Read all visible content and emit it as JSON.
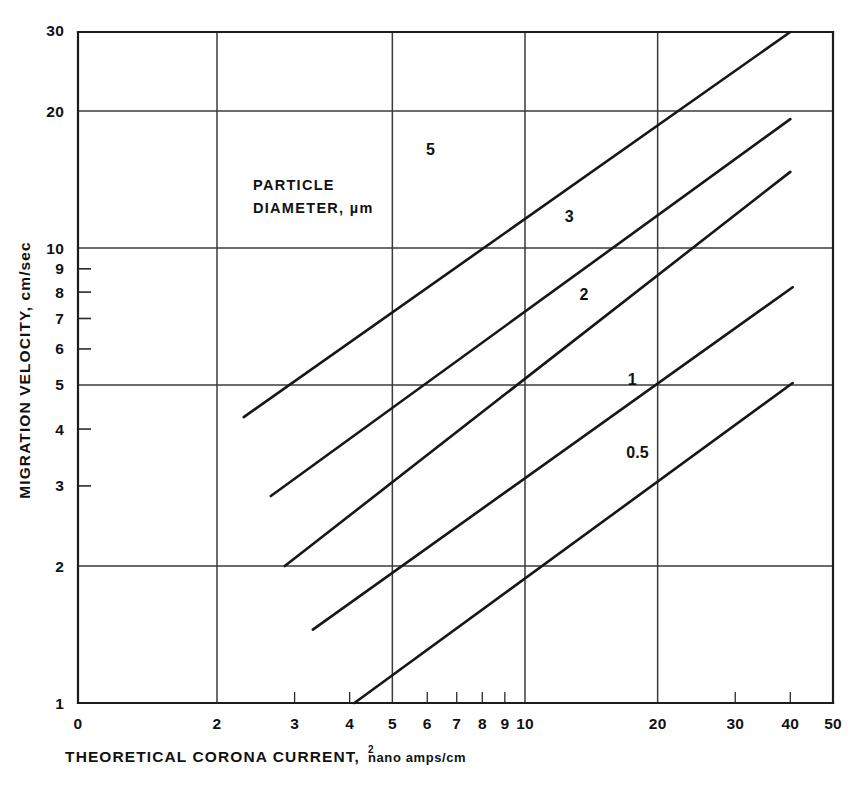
{
  "chart_data": {
    "type": "line",
    "title": "",
    "xlabel": "THEORETICAL CORONA CURRENT, nano amps/cm2",
    "xlabel_main": "THEORETICAL CORONA CURRENT,",
    "xlabel_units": "nano amps/cm",
    "xlabel_exponent": "2",
    "ylabel": "MIGRATION VELOCITY, cm/sec",
    "xscale": "log",
    "yscale": "log",
    "xlim": [
      1.75,
      50
    ],
    "ylim": [
      1,
      30
    ],
    "grid": true,
    "legend_position": "inline-curve-labels",
    "annotation": {
      "line1": "PARTICLE",
      "line2": "DIAMETER, µm"
    },
    "xticks_major": [
      2,
      5,
      10,
      20,
      50
    ],
    "xticks_labeled": [
      "0",
      "2",
      "3",
      "4",
      "5",
      "6",
      "7",
      "8",
      "9",
      "10",
      "20",
      "30",
      "40",
      "50"
    ],
    "xtick_values": [
      1.75,
      2,
      3,
      4,
      5,
      6,
      7,
      8,
      9,
      10,
      20,
      30,
      40,
      50
    ],
    "yticks_major": [
      1,
      2,
      5,
      10,
      20,
      30
    ],
    "yticks_labeled": [
      "1",
      "2",
      "3",
      "4",
      "5",
      "6",
      "7",
      "8",
      "9",
      "10",
      "20",
      "30"
    ],
    "ytick_values": [
      1,
      2,
      3,
      4,
      5,
      6,
      7,
      8,
      9,
      10,
      20,
      30
    ],
    "series": [
      {
        "name": "5",
        "label": "5",
        "particle_diameter_um": 5,
        "points": [
          [
            2.3,
            4.25
          ],
          [
            40.0,
            31.5
          ]
        ],
        "label_at": [
          6.1,
          16.0
        ]
      },
      {
        "name": "3",
        "label": "3",
        "particle_diameter_um": 3,
        "points": [
          [
            2.65,
            2.85
          ],
          [
            40.0,
            19.2
          ]
        ],
        "label_at": [
          12.6,
          11.4
        ]
      },
      {
        "name": "2",
        "label": "2",
        "particle_diameter_um": 2,
        "points": [
          [
            2.85,
            2.0
          ],
          [
            40.0,
            14.7
          ]
        ],
        "label_at": [
          13.6,
          7.7
        ]
      },
      {
        "name": "1",
        "label": "1",
        "particle_diameter_um": 1,
        "points": [
          [
            3.3,
            1.45
          ],
          [
            40.5,
            8.2
          ]
        ],
        "label_at": [
          17.5,
          5.0
        ]
      },
      {
        "name": "0.5",
        "label": "0.5",
        "particle_diameter_um": 0.5,
        "points": [
          [
            4.1,
            1.0
          ],
          [
            40.5,
            5.05
          ]
        ],
        "label_at": [
          18.0,
          3.45
        ]
      }
    ]
  }
}
